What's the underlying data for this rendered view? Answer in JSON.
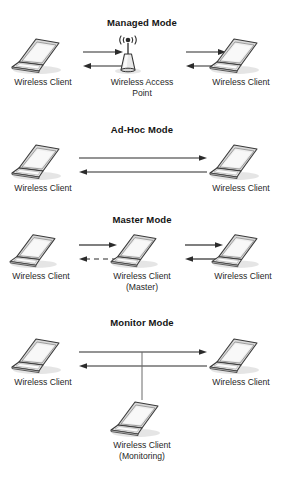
{
  "figure": {
    "background": "#ffffff",
    "line_color": "#2b2b2b",
    "text_color": "#1a1a1a"
  },
  "sections": [
    {
      "id": "managed",
      "title": "Managed Mode",
      "nodes": [
        {
          "id": "managed-left",
          "icon": "laptop-icon",
          "label": "Wireless Client"
        },
        {
          "id": "managed-center",
          "icon": "access-point-icon",
          "label": "Wireless Access",
          "sublabel": "Point"
        },
        {
          "id": "managed-right",
          "icon": "laptop-icon",
          "label": "Wireless Client"
        }
      ],
      "links": [
        {
          "id": "managed-left-to-ap",
          "direction": "right",
          "style": "solid"
        },
        {
          "id": "managed-ap-to-left",
          "direction": "left",
          "style": "solid"
        },
        {
          "id": "managed-right-to-ap",
          "direction": "right",
          "style": "solid"
        },
        {
          "id": "managed-ap-to-right",
          "direction": "left",
          "style": "solid"
        }
      ]
    },
    {
      "id": "adhoc",
      "title": "Ad-Hoc Mode",
      "nodes": [
        {
          "id": "adhoc-left",
          "icon": "laptop-icon",
          "label": "Wireless Client"
        },
        {
          "id": "adhoc-right",
          "icon": "laptop-icon",
          "label": "Wireless Client"
        }
      ],
      "links": [
        {
          "id": "adhoc-left-to-right",
          "direction": "right",
          "style": "solid"
        },
        {
          "id": "adhoc-right-to-left",
          "direction": "left",
          "style": "solid"
        }
      ]
    },
    {
      "id": "master",
      "title": "Master Mode",
      "nodes": [
        {
          "id": "master-left",
          "icon": "laptop-icon",
          "label": "Wireless Client"
        },
        {
          "id": "master-center",
          "icon": "laptop-icon",
          "label": "Wireless Client",
          "sublabel": "(Master)"
        },
        {
          "id": "master-right",
          "icon": "laptop-icon",
          "label": "Wireless Client"
        }
      ],
      "links": [
        {
          "id": "master-left-to-center",
          "direction": "right",
          "style": "solid"
        },
        {
          "id": "master-center-to-left",
          "direction": "left",
          "style": "dashed"
        },
        {
          "id": "master-center-to-right",
          "direction": "right",
          "style": "solid"
        },
        {
          "id": "master-right-to-center",
          "direction": "left",
          "style": "solid"
        }
      ]
    },
    {
      "id": "monitor",
      "title": "Monitor Mode",
      "nodes": [
        {
          "id": "monitor-left",
          "icon": "laptop-icon",
          "label": "Wireless Client"
        },
        {
          "id": "monitor-right",
          "icon": "laptop-icon",
          "label": "Wireless Client"
        },
        {
          "id": "monitor-bottom",
          "icon": "laptop-icon",
          "label": "Wireless Client",
          "sublabel": "(Monitoring)"
        }
      ],
      "links": [
        {
          "id": "monitor-left-to-right",
          "direction": "right",
          "style": "solid"
        },
        {
          "id": "monitor-right-to-left",
          "direction": "left",
          "style": "solid"
        },
        {
          "id": "monitor-tap",
          "direction": "none",
          "style": "solid"
        }
      ]
    }
  ]
}
